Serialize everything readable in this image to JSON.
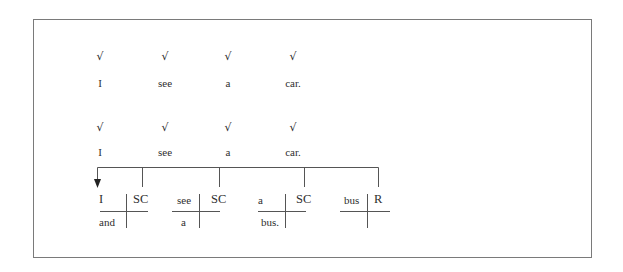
{
  "diagram": {
    "row1": {
      "checks": [
        "√",
        "√",
        "√",
        "√"
      ],
      "words": [
        "I",
        "see",
        "a",
        "car."
      ]
    },
    "row2": {
      "checks": [
        "√",
        "√",
        "√",
        "√"
      ],
      "words": [
        "I",
        "see",
        "a",
        "car."
      ]
    },
    "crosses": [
      {
        "top_left": "I",
        "top_right": "SC",
        "bottom_left": "and"
      },
      {
        "top_left": "see",
        "top_right": "SC",
        "bottom_left": "a"
      },
      {
        "top_left": "a",
        "top_right": "SC",
        "bottom_left": "bus."
      },
      {
        "top_left": "bus",
        "top_right": "R",
        "bottom_left": ""
      }
    ],
    "colors": {
      "text": "#2e2e2e",
      "lines": "#555555",
      "frame": "#7a7a7a"
    }
  }
}
